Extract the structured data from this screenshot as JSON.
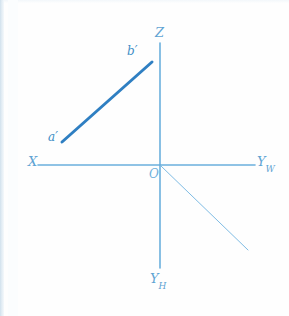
{
  "figure": {
    "type": "descriptive-geometry-projection-diagram",
    "background_color": "#fefefe",
    "axis_color": "#6bb0dd",
    "segment_color": "#2f7fc2",
    "label_color": "#5fa3d3"
  },
  "axes": [
    {
      "id": "x-axis",
      "label": "X",
      "label_main": "X",
      "label_sub": "",
      "direction": "left",
      "from": [
        160,
        165
      ],
      "to": [
        38,
        165
      ],
      "weight": 1.6
    },
    {
      "id": "yw-axis",
      "label": "Y_W",
      "label_main": "Y",
      "label_sub": "W",
      "direction": "right",
      "from": [
        160,
        165
      ],
      "to": [
        255,
        165
      ],
      "weight": 1.6
    },
    {
      "id": "z-axis",
      "label": "Z",
      "label_main": "Z",
      "label_sub": "",
      "direction": "up",
      "from": [
        160,
        165
      ],
      "to": [
        160,
        43
      ],
      "weight": 1.6
    },
    {
      "id": "yh-axis",
      "label": "Y_H",
      "label_main": "Y",
      "label_sub": "H",
      "direction": "down",
      "from": [
        160,
        165
      ],
      "to": [
        160,
        268
      ],
      "weight": 1.6
    },
    {
      "id": "yh-diagonal-axis",
      "label": "",
      "label_main": "",
      "label_sub": "",
      "direction": "down-right",
      "from": [
        161,
        166
      ],
      "to": [
        248,
        250
      ],
      "weight": 1.0
    }
  ],
  "origin": {
    "label": "O",
    "x": 160,
    "y": 165,
    "label_x": 149,
    "label_y": 168
  },
  "segments": [
    {
      "id": "segment-a-b-prime",
      "name": "a'b'",
      "from_label": "a'",
      "to_label": "b'",
      "from": [
        62,
        142
      ],
      "to": [
        152,
        62
      ],
      "weight": 3.0,
      "color": "#2f7fc2"
    }
  ],
  "point_labels": [
    {
      "id": "label-a-prime",
      "text": "a′",
      "x": 48,
      "y": 131
    },
    {
      "id": "label-b-prime",
      "text": "b′",
      "x": 127,
      "y": 45
    }
  ],
  "axis_labels": [
    {
      "id": "label-x",
      "main": "X",
      "sub": "",
      "x": 28,
      "y": 155
    },
    {
      "id": "label-yw",
      "main": "Y",
      "sub": "W",
      "x": 257,
      "y": 155
    },
    {
      "id": "label-z",
      "main": "Z",
      "sub": "",
      "x": 155,
      "y": 26
    },
    {
      "id": "label-yh",
      "main": "Y",
      "sub": "H",
      "x": 150,
      "y": 272
    }
  ]
}
